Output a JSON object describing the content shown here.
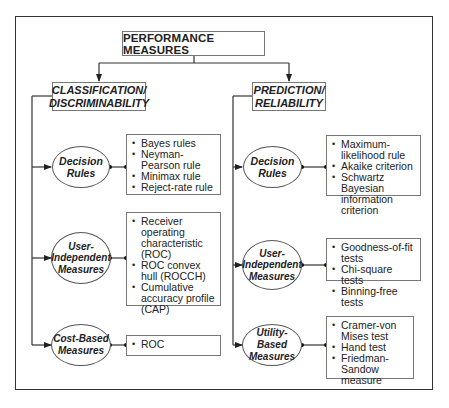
{
  "diagram": {
    "root": {
      "label": "PERFORMANCE MEASURES"
    },
    "branches": [
      {
        "title_line1": "CLASSIFICATION/",
        "title_line2": "DISCRIMINABILITY",
        "nodes": [
          {
            "line1": "Decision",
            "line2": "Rules",
            "line3": "",
            "items": [
              "Bayes rules",
              "Neyman-Pearson rule",
              "Minimax rule",
              "Reject-rate rule"
            ]
          },
          {
            "line1": "User-",
            "line2": "Independent",
            "line3": "Measures",
            "items": [
              "Receiver operating characteristic (ROC)",
              "ROC convex hull (ROCCH)",
              "Cumulative accuracy profile (CAP)"
            ]
          },
          {
            "line1": "Cost-Based",
            "line2": "Measures",
            "line3": "",
            "items": [
              "ROC"
            ]
          }
        ]
      },
      {
        "title_line1": "PREDICTION/",
        "title_line2": "RELIABILITY",
        "nodes": [
          {
            "line1": "Decision",
            "line2": "Rules",
            "line3": "",
            "items": [
              "Maximum-likelihood rule",
              "Akaike criterion",
              "Schwartz Bayesian information criterion"
            ]
          },
          {
            "line1": "User-",
            "line2": "Independent",
            "line3": "Measures",
            "items": [
              "Goodness-of-fit tests",
              "Chi-square tests",
              "Binning-free tests"
            ]
          },
          {
            "line1": "Utility-Based",
            "line2": "Measures",
            "line3": "",
            "items": [
              "Cramer-von Mises test",
              "Hand test",
              "Friedman-Sandow measure"
            ]
          }
        ]
      }
    ]
  },
  "colors": {
    "line": "#333333",
    "box_border": "#777777",
    "background": "#ffffff"
  }
}
